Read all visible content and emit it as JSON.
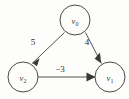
{
  "diagram": {
    "background_color": "#fdfdfc",
    "stroke_color": "#55534f",
    "label_color": "#2f2d2b",
    "nodes": [
      {
        "id": "v0",
        "label_base": "v",
        "label_sub": "0",
        "cx": 75,
        "cy": 20,
        "r": 15
      },
      {
        "id": "v2",
        "label_base": "v",
        "label_sub": "2",
        "cx": 23,
        "cy": 77,
        "r": 15
      },
      {
        "id": "v1",
        "label_base": "v",
        "label_sub": "1",
        "cx": 110,
        "cy": 77,
        "r": 15
      }
    ],
    "edges": [
      {
        "id": "edge-v0-v2",
        "from": "v0",
        "to": "v2",
        "weight": "5",
        "weight_x": 33,
        "weight_y": 45,
        "directed": true
      },
      {
        "id": "edge-v0-v1",
        "from": "v0",
        "to": "v1",
        "weight": "4",
        "weight_x": 87,
        "weight_y": 45,
        "directed": true
      },
      {
        "id": "edge-v2-v1",
        "from": "v2",
        "to": "v1",
        "weight": "−3",
        "weight_x": 60,
        "weight_y": 69,
        "directed": true
      }
    ]
  }
}
